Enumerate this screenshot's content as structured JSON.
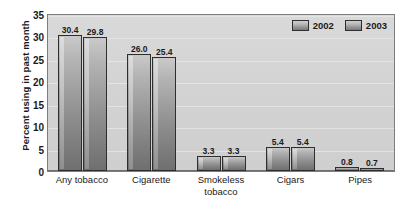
{
  "chart_data": {
    "type": "bar",
    "title": "",
    "xlabel": "",
    "ylabel": "Percent using in past month",
    "categories": [
      "Any tobacco",
      "Cigarette",
      "Smokeless\ntobacco",
      "Cigars",
      "Pipes"
    ],
    "series": [
      {
        "name": "2002",
        "values": [
          30.4,
          26.0,
          3.3,
          5.4,
          0.8
        ]
      },
      {
        "name": "2003",
        "values": [
          29.8,
          25.4,
          3.3,
          5.4,
          0.7
        ]
      }
    ],
    "value_labels": [
      [
        "30.4",
        "29.8"
      ],
      [
        "26.0",
        "25.4"
      ],
      [
        "3.3",
        "3.3"
      ],
      [
        "5.4",
        "5.4"
      ],
      [
        "0.8",
        "0.7"
      ]
    ],
    "ylim": [
      0,
      35
    ],
    "yticks": [
      "0",
      "5",
      "10",
      "15",
      "20",
      "25",
      "30",
      "35"
    ],
    "grid": true,
    "legend_position": "top-right-inside"
  },
  "legend": {
    "items": [
      {
        "label": "2002"
      },
      {
        "label": "2003"
      }
    ]
  },
  "colors": {
    "plot_background": "#d5d5d5",
    "plot_border": "#7d7d7d",
    "bar_light": "#c9c9c9",
    "bar_dark": "#6f6f6f",
    "bar_outline": "#2e2e2e",
    "gridline": "#e6e6e6",
    "text": "#1a1a1a",
    "page_background": "#ffffff"
  }
}
